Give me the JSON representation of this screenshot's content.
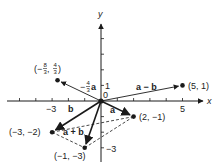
{
  "diagram": {
    "axes": {
      "x_label": "x",
      "y_label": "y",
      "x_range": [
        -6,
        6
      ],
      "y_range": [
        -4,
        5
      ],
      "x_ticks": [
        -5,
        -4,
        -3,
        -2,
        -1,
        1,
        2,
        3,
        4,
        5
      ],
      "y_ticks": [
        -3,
        -2,
        -1,
        1,
        2,
        3,
        4
      ],
      "x_tick_labels": [
        {
          "value": -3,
          "text": "−3"
        },
        {
          "value": 5,
          "text": "5"
        }
      ],
      "y_tick_labels": [
        {
          "value": 1,
          "text": "1"
        },
        {
          "value": -3,
          "text": "−3"
        }
      ],
      "origin_label": "0"
    },
    "points": [
      {
        "id": "p-5-1",
        "x": 5,
        "y": 1,
        "label": "(5, 1)"
      },
      {
        "id": "p-2-m1",
        "x": 2,
        "y": -1,
        "label": "(2, −1)"
      },
      {
        "id": "p-m3-m2",
        "x": -3,
        "y": -2,
        "label": "(−3, −2)"
      },
      {
        "id": "p-m1-m3",
        "x": -1,
        "y": -3,
        "label": "(−1, −3)"
      },
      {
        "id": "p-m8_3-4_3",
        "x": -2.6667,
        "y": 1.3333,
        "label_parts": {
          "open": "(−",
          "n1": "8",
          "d1": "3",
          "sep": ", ",
          "n2": "4",
          "d2": "3",
          "close": ")"
        }
      }
    ],
    "vectors": [
      {
        "name": "a",
        "from": [
          0,
          0
        ],
        "to": [
          2,
          -1
        ],
        "label": "a"
      },
      {
        "name": "b",
        "from": [
          0,
          0
        ],
        "to": [
          -3,
          -2
        ],
        "label": "b"
      },
      {
        "name": "a-plus-b",
        "from": [
          0,
          0
        ],
        "to": [
          -1,
          -3
        ],
        "label": "a + b"
      },
      {
        "name": "a-minus-b",
        "from": [
          0,
          0
        ],
        "to": [
          5,
          1
        ],
        "label": "a − b"
      },
      {
        "name": "minus-four-thirds-a",
        "from": [
          0,
          0
        ],
        "to": [
          -2.6667,
          1.3333
        ],
        "label_parts": {
          "prefix": "−",
          "num": "4",
          "den": "3",
          "suffix": "a"
        }
      }
    ],
    "dashed_lines": [
      {
        "from": [
          -3,
          -2
        ],
        "to": [
          2,
          -1
        ]
      },
      {
        "from": [
          -1,
          -3
        ],
        "to": [
          2,
          -1
        ]
      },
      {
        "from": [
          -3,
          -2
        ],
        "to": [
          -1,
          -3
        ]
      }
    ],
    "colors": {
      "ink": "#1a1a1a",
      "background": "#ffffff"
    }
  }
}
